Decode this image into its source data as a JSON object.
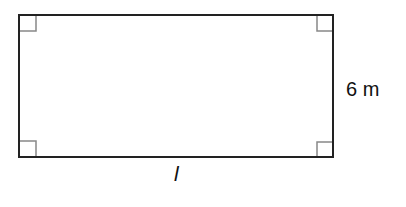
{
  "diagram": {
    "shape": "rectangle",
    "right_angle_marks": 4,
    "labels": {
      "side": "6 m",
      "length": "l"
    },
    "colors": {
      "outline": "#222222",
      "right_angle_mark": "#888888"
    }
  }
}
